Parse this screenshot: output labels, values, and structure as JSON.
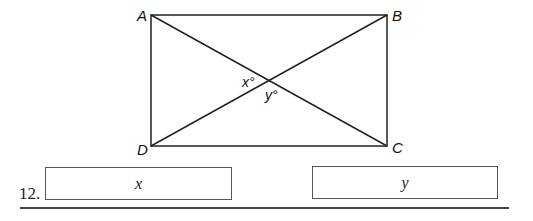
{
  "figure": {
    "type": "rectangle-with-diagonals",
    "vertices": [
      {
        "label": "A",
        "x": 151,
        "y": 15
      },
      {
        "label": "B",
        "x": 387,
        "y": 15
      },
      {
        "label": "C",
        "x": 387,
        "y": 146
      },
      {
        "label": "D",
        "x": 151,
        "y": 146
      }
    ],
    "angle_labels": {
      "x": "x°",
      "y": "y°"
    }
  },
  "question": {
    "number": "12.",
    "answer_boxes": [
      {
        "label": "x"
      },
      {
        "label": "y"
      }
    ]
  }
}
